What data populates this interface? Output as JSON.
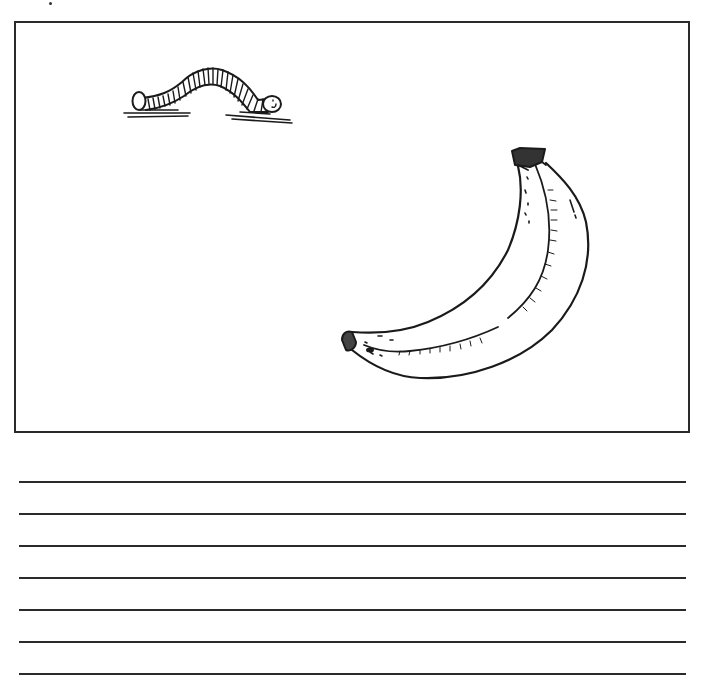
{
  "worksheet": {
    "picture_box": {
      "items": [
        {
          "name": "worm",
          "label": ""
        },
        {
          "name": "banana",
          "label": ""
        }
      ]
    },
    "writing_lines": {
      "count": 7,
      "y_positions": [
        481,
        513,
        545,
        577,
        609,
        641,
        673
      ]
    },
    "colors": {
      "ink": "#1a1a1a",
      "paper": "#ffffff",
      "frame": "#2a2a2a"
    }
  }
}
